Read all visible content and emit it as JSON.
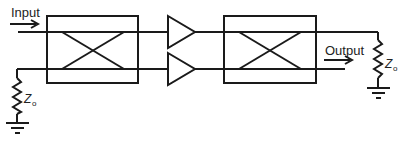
{
  "diagram": {
    "type": "balanced-amplifier",
    "labels": {
      "input": "Input",
      "output": "Output",
      "termination_left": "Z",
      "termination_left_sub": "o",
      "termination_right": "Z",
      "termination_right_sub": "o"
    },
    "components": [
      {
        "id": "hybrid-coupler-input",
        "kind": "quadrature hybrid coupler"
      },
      {
        "id": "amplifier-top",
        "kind": "amplifier"
      },
      {
        "id": "amplifier-bottom",
        "kind": "amplifier"
      },
      {
        "id": "hybrid-coupler-output",
        "kind": "quadrature hybrid coupler"
      },
      {
        "id": "termination-resistor-left",
        "kind": "resistor to ground",
        "value": "Zo"
      },
      {
        "id": "termination-resistor-right",
        "kind": "resistor to ground",
        "value": "Zo"
      }
    ],
    "colors": {
      "stroke": "#1a1a1a",
      "background": "#ffffff"
    }
  }
}
